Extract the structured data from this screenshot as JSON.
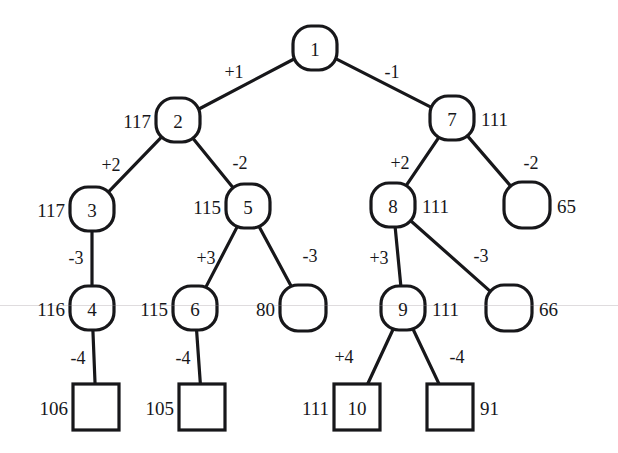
{
  "diagram": {
    "type": "binary-tree",
    "nodes": [
      {
        "id": "n1",
        "label": "1",
        "shape": "rounded",
        "cx": 315,
        "cy": 48,
        "w": 44,
        "h": 44,
        "value": "",
        "value_side": "none"
      },
      {
        "id": "n2",
        "label": "2",
        "shape": "rounded",
        "cx": 178,
        "cy": 120,
        "w": 44,
        "h": 44,
        "value": "117",
        "value_side": "left"
      },
      {
        "id": "n7",
        "label": "7",
        "shape": "rounded",
        "cx": 452,
        "cy": 118,
        "w": 44,
        "h": 44,
        "value": "111",
        "value_side": "right"
      },
      {
        "id": "n3",
        "label": "3",
        "shape": "rounded",
        "cx": 92,
        "cy": 209,
        "w": 44,
        "h": 44,
        "value": "117",
        "value_side": "left"
      },
      {
        "id": "n5",
        "label": "5",
        "shape": "rounded",
        "cx": 248,
        "cy": 206,
        "w": 44,
        "h": 44,
        "value": "115",
        "value_side": "left"
      },
      {
        "id": "n8",
        "label": "8",
        "shape": "rounded",
        "cx": 393,
        "cy": 205,
        "w": 44,
        "h": 44,
        "value": "111",
        "value_side": "right"
      },
      {
        "id": "n65",
        "label": "",
        "shape": "rounded",
        "cx": 527,
        "cy": 205,
        "w": 46,
        "h": 46,
        "value": "65",
        "value_side": "right"
      },
      {
        "id": "n4",
        "label": "4",
        "shape": "rounded",
        "cx": 92,
        "cy": 308,
        "w": 44,
        "h": 44,
        "value": "116",
        "value_side": "left"
      },
      {
        "id": "n6",
        "label": "6",
        "shape": "rounded",
        "cx": 195,
        "cy": 308,
        "w": 44,
        "h": 44,
        "value": "115",
        "value_side": "left"
      },
      {
        "id": "n80",
        "label": "",
        "shape": "rounded",
        "cx": 303,
        "cy": 308,
        "w": 46,
        "h": 46,
        "value": "80",
        "value_side": "left"
      },
      {
        "id": "n9",
        "label": "9",
        "shape": "rounded",
        "cx": 403,
        "cy": 308,
        "w": 44,
        "h": 44,
        "value": "111",
        "value_side": "right"
      },
      {
        "id": "n66",
        "label": "",
        "shape": "rounded",
        "cx": 509,
        "cy": 308,
        "w": 46,
        "h": 46,
        "value": "66",
        "value_side": "right"
      },
      {
        "id": "n106",
        "label": "",
        "shape": "square",
        "cx": 96,
        "cy": 407,
        "w": 46,
        "h": 46,
        "value": "106",
        "value_side": "left"
      },
      {
        "id": "n105",
        "label": "",
        "shape": "square",
        "cx": 202,
        "cy": 407,
        "w": 46,
        "h": 46,
        "value": "105",
        "value_side": "left"
      },
      {
        "id": "n10",
        "label": "10",
        "shape": "square",
        "cx": 357,
        "cy": 407,
        "w": 46,
        "h": 46,
        "value": "111",
        "value_side": "left"
      },
      {
        "id": "n91",
        "label": "",
        "shape": "square",
        "cx": 450,
        "cy": 407,
        "w": 46,
        "h": 46,
        "value": "91",
        "value_side": "right"
      }
    ],
    "edges": [
      {
        "from": "n1",
        "to": "n2",
        "label": "+1",
        "lx": 234,
        "ly": 72
      },
      {
        "from": "n1",
        "to": "n7",
        "label": "-1",
        "lx": 392,
        "ly": 72
      },
      {
        "from": "n2",
        "to": "n3",
        "label": "+2",
        "lx": 111,
        "ly": 165
      },
      {
        "from": "n2",
        "to": "n5",
        "label": "-2",
        "lx": 240,
        "ly": 163
      },
      {
        "from": "n7",
        "to": "n8",
        "label": "+2",
        "lx": 400,
        "ly": 163
      },
      {
        "from": "n7",
        "to": "n65",
        "label": "-2",
        "lx": 531,
        "ly": 163
      },
      {
        "from": "n3",
        "to": "n4",
        "label": "-3",
        "lx": 76,
        "ly": 258
      },
      {
        "from": "n5",
        "to": "n6",
        "label": "+3",
        "lx": 206,
        "ly": 258
      },
      {
        "from": "n5",
        "to": "n80",
        "label": "-3",
        "lx": 310,
        "ly": 256
      },
      {
        "from": "n8",
        "to": "n9",
        "label": "+3",
        "lx": 379,
        "ly": 258
      },
      {
        "from": "n8",
        "to": "n66",
        "label": "-3",
        "lx": 481,
        "ly": 256
      },
      {
        "from": "n4",
        "to": "n106",
        "label": "-4",
        "lx": 78,
        "ly": 358
      },
      {
        "from": "n6",
        "to": "n105",
        "label": "-4",
        "lx": 183,
        "ly": 358
      },
      {
        "from": "n9",
        "to": "n10",
        "label": "+4",
        "lx": 344,
        "ly": 357
      },
      {
        "from": "n9",
        "to": "n91",
        "label": "-4",
        "lx": 457,
        "ly": 357
      }
    ],
    "style": {
      "stroke": "#17171a",
      "node_stroke_width": 3.2,
      "edge_stroke_width": 3.2,
      "background": "#ffffff",
      "scanline_y": 305
    }
  }
}
